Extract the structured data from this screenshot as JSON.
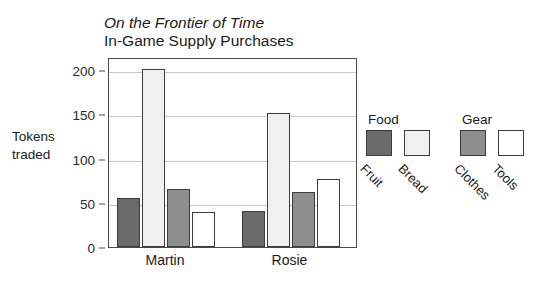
{
  "chart_data": {
    "type": "bar",
    "title": "On the Frontier of Time",
    "subtitle": "In-Game Supply Purchases",
    "xlabel": "",
    "ylabel": "Tokens traded",
    "ylabel_line1": "Tokens",
    "ylabel_line2": "traded",
    "categories": [
      "Martin",
      "Rosie"
    ],
    "series": [
      {
        "name": "Fruit",
        "group": "Food",
        "color": "#6a6a6a",
        "values": [
          56,
          41
        ]
      },
      {
        "name": "Bread",
        "group": "Food",
        "color": "#f0f0f0",
        "values": [
          202,
          152
        ]
      },
      {
        "name": "Clothes",
        "group": "Gear",
        "color": "#8e8e8e",
        "values": [
          66,
          62
        ]
      },
      {
        "name": "Tools",
        "group": "Gear",
        "color": "#ffffff",
        "values": [
          40,
          77
        ]
      }
    ],
    "ylim": [
      0,
      215
    ],
    "yticks": [
      0,
      50,
      100,
      150,
      200
    ],
    "ytick_labels": [
      "0",
      "50",
      "100",
      "150",
      "200"
    ],
    "grid": true,
    "legend_position": "right"
  },
  "legend": {
    "groups": [
      {
        "title": "Food",
        "items": [
          {
            "label": "Fruit",
            "color": "#6a6a6a"
          },
          {
            "label": "Bread",
            "color": "#f0f0f0"
          }
        ]
      },
      {
        "title": "Gear",
        "items": [
          {
            "label": "Clothes",
            "color": "#8e8e8e"
          },
          {
            "label": "Tools",
            "color": "#ffffff"
          }
        ]
      }
    ]
  },
  "style": {
    "axis_color": "#4a4a4a",
    "grid_color": "#c8c8c8",
    "bar_border": "#3c3c3c",
    "text_color": "#1a1a1a",
    "background": "#ffffff"
  }
}
